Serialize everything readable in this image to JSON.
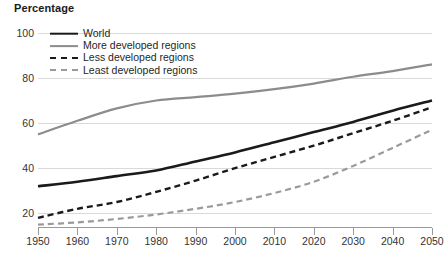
{
  "chart": {
    "title": "Percentage",
    "caption": ""
  },
  "chart_data": {
    "type": "line",
    "title": "Percentage",
    "xlabel": "",
    "ylabel": "Percentage",
    "xlim": [
      1950,
      2050
    ],
    "ylim": [
      13.5,
      103
    ],
    "yticks": [
      100,
      80,
      60,
      40,
      20
    ],
    "xticks": [
      1950,
      1960,
      1970,
      1980,
      1990,
      2000,
      2010,
      2020,
      2030,
      2040,
      2050
    ],
    "grid": true,
    "legend_position": "top-left",
    "x": [
      1950,
      1960,
      1970,
      1980,
      1990,
      2000,
      2010,
      2020,
      2030,
      2040,
      2050
    ],
    "series": [
      {
        "name": "World",
        "style": "solid",
        "color": "#1a1a1a",
        "width": 2.6,
        "values": [
          32,
          34,
          36.5,
          39,
          43,
          47,
          51.5,
          56,
          60.5,
          65.5,
          70
        ]
      },
      {
        "name": "More developed regions",
        "style": "solid",
        "color": "#8c8c8c",
        "width": 2.2,
        "values": [
          55,
          61,
          66.5,
          70,
          71.5,
          73,
          75,
          77.5,
          80.5,
          83,
          86
        ]
      },
      {
        "name": "Less developed regions",
        "style": "dashed",
        "color": "#1a1a1a",
        "width": 2.4,
        "values": [
          18,
          22,
          25,
          29.5,
          34.5,
          40,
          45,
          50,
          55.5,
          61,
          67
        ]
      },
      {
        "name": "Least developed regions",
        "style": "dashed",
        "color": "#9a9a9a",
        "width": 2.2,
        "values": [
          15,
          16,
          17.5,
          19.5,
          22,
          25,
          29,
          34,
          41,
          49,
          57
        ]
      }
    ]
  },
  "legend": {
    "items": [
      {
        "label": "World",
        "swatch": "solid-black-thick"
      },
      {
        "label": "More developed regions",
        "swatch": "solid-gray"
      },
      {
        "label": "Less developed regions",
        "swatch": "dashed-black"
      },
      {
        "label": "Least developed regions",
        "swatch": "dashed-gray"
      }
    ]
  }
}
